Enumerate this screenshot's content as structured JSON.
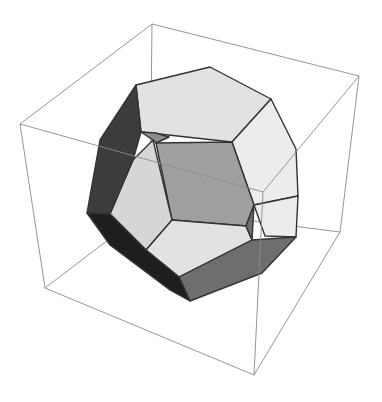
{
  "figure": {
    "title": "",
    "subject": "dodecahedron inside bounding box",
    "colors": {
      "background": "#ffffff",
      "box_edge": "#8a8a8a",
      "face_edge": "#333333",
      "face_light": "#e2e2e2",
      "face_lighter": "#ececec",
      "face_mid_light": "#d6d6d6",
      "face_mid": "#9f9f9f",
      "face_dark_mid": "#6e6e6e",
      "face_dark": "#3c3c3c",
      "face_darkest": "#1e1e1e",
      "face_small": "#8c8c8c"
    },
    "box": {
      "vertices": {
        "A": [
          20,
          124
        ],
        "B": [
          152,
          24
        ],
        "C": [
          359,
          76
        ],
        "G": [
          263,
          192
        ],
        "D": [
          45,
          288
        ],
        "H": [
          150,
          208
        ],
        "F": [
          340,
          232
        ],
        "E": [
          254,
          375
        ]
      },
      "edges_back": [
        [
          "B",
          "H"
        ],
        [
          "D",
          "H"
        ],
        [
          "H",
          "F"
        ]
      ],
      "edges_front": [
        [
          "A",
          "B"
        ],
        [
          "B",
          "C"
        ],
        [
          "A",
          "D"
        ],
        [
          "C",
          "F"
        ],
        [
          "F",
          "E"
        ],
        [
          "D",
          "E"
        ],
        [
          "A",
          "G"
        ],
        [
          "G",
          "C"
        ],
        [
          "G",
          "E"
        ]
      ]
    },
    "polyhedron": {
      "faces": [
        {
          "name": "face-top",
          "color_key": "face_light",
          "points": [
            [
              136,
              85
            ],
            [
              210,
              67
            ],
            [
              271,
              99
            ],
            [
              232,
              142
            ],
            [
              141,
              132
            ]
          ]
        },
        {
          "name": "face-upper-right",
          "color_key": "face_lighter",
          "points": [
            [
              271,
              99
            ],
            [
              296,
              149
            ],
            [
              298,
              196
            ],
            [
              254,
              205
            ],
            [
              232,
              142
            ]
          ]
        },
        {
          "name": "face-right",
          "color_key": "face_lighter",
          "points": [
            [
              298,
              196
            ],
            [
              296,
              237
            ],
            [
              265,
              236
            ],
            [
              254,
              205
            ]
          ]
        },
        {
          "name": "face-center",
          "color_key": "face_mid",
          "points": [
            [
              156,
              143
            ],
            [
              232,
              142
            ],
            [
              254,
              205
            ],
            [
              246,
              226
            ],
            [
              172,
              220
            ]
          ]
        },
        {
          "name": "face-left-front",
          "color_key": "face_mid_light",
          "points": [
            [
              153,
              140
            ],
            [
              172,
              220
            ],
            [
              146,
              250
            ],
            [
              110,
              214
            ],
            [
              133,
              160
            ]
          ]
        },
        {
          "name": "face-bottom-front",
          "color_key": "face_light",
          "points": [
            [
              172,
              220
            ],
            [
              246,
              226
            ],
            [
              252,
              240
            ],
            [
              179,
              277
            ],
            [
              146,
              250
            ]
          ]
        },
        {
          "name": "face-bottom-right",
          "color_key": "face_dark_mid",
          "points": [
            [
              252,
              240
            ],
            [
              296,
              237
            ],
            [
              262,
              273
            ],
            [
              190,
              301
            ],
            [
              179,
              277
            ]
          ]
        },
        {
          "name": "face-left-dark",
          "color_key": "face_dark",
          "points": [
            [
              136,
              85
            ],
            [
              141,
              132
            ],
            [
              133,
              160
            ],
            [
              110,
              214
            ],
            [
              87,
              213
            ],
            [
              100,
              140
            ]
          ]
        },
        {
          "name": "face-bottom-left-dark",
          "color_key": "face_darkest",
          "points": [
            [
              87,
              213
            ],
            [
              110,
              214
            ],
            [
              146,
              250
            ],
            [
              179,
              277
            ],
            [
              190,
              301
            ],
            [
              170,
              290
            ],
            [
              110,
              245
            ]
          ]
        },
        {
          "name": "face-small-upper",
          "color_key": "face_small",
          "points": [
            [
              141,
              132
            ],
            [
              156,
              133
            ],
            [
              169,
              137
            ],
            [
              156,
              143
            ],
            [
              153,
              140
            ]
          ]
        },
        {
          "name": "face-small-lower",
          "color_key": "face_dark_mid",
          "points": [
            [
              246,
              226
            ],
            [
              254,
              205
            ],
            [
              252,
              240
            ]
          ]
        }
      ]
    }
  }
}
